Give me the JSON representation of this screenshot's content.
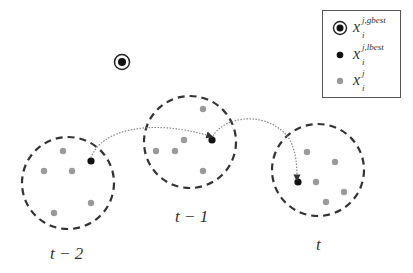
{
  "colors": {
    "gbest": "#111111",
    "lbest": "#111111",
    "particle": "#9a9a9a",
    "circle": "#333333",
    "path": "#888888"
  },
  "legend": {
    "items": [
      {
        "icon": "gbest-marker-icon",
        "base": "x",
        "sub": "i",
        "sup": "j,gbest"
      },
      {
        "icon": "lbest-marker-icon",
        "base": "x",
        "sub": "i",
        "sup": "j,lbest"
      },
      {
        "icon": "particle-marker-icon",
        "base": "x",
        "sub": "i",
        "sup": "j"
      }
    ]
  },
  "groups": [
    {
      "label": "t − 2",
      "particles": 5
    },
    {
      "label": "t − 1",
      "particles": 5
    },
    {
      "label": "t",
      "particles": 5
    }
  ]
}
